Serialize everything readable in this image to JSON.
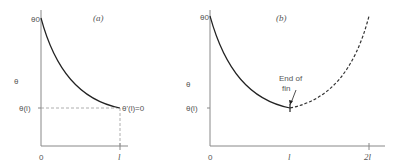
{
  "panel_a": {
    "tag": "(a)",
    "y_axis_label": "θ",
    "y_top_label": "θ0",
    "y_end_label": "θ(l)",
    "x_origin": "0",
    "x_end": "l",
    "end_condition": "θ'(l)=0"
  },
  "panel_b": {
    "tag": "(b)",
    "y_axis_label": "θ",
    "y_top_label": "θ0",
    "y_end_label": "θ(l)",
    "x_origin": "0",
    "x_mid": "l",
    "x_end": "2l",
    "annotation_line1": "End of",
    "annotation_line2": "fin"
  },
  "colors": {
    "curve": "#222222",
    "axis": "#888888",
    "dashed": "#999999"
  }
}
